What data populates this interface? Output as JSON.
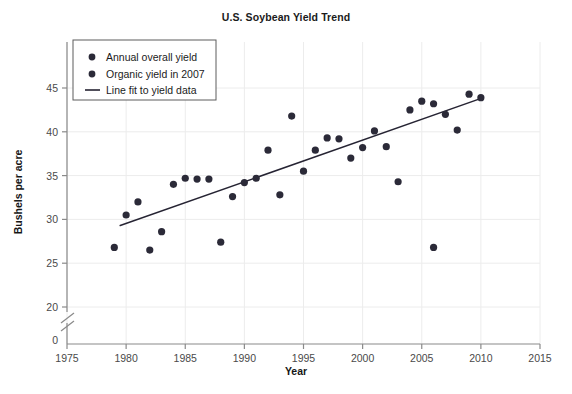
{
  "chart_data": {
    "type": "scatter",
    "title": "U.S. Soybean Yield Trend",
    "xlabel": "Year",
    "ylabel": "Bushels per acre",
    "xlim": [
      1975,
      2015
    ],
    "ylim": [
      17.5,
      47.5
    ],
    "xticks": [
      1975,
      1980,
      1985,
      1990,
      1995,
      2000,
      2005,
      2010,
      2015
    ],
    "yticks": [
      0,
      20,
      25,
      30,
      35,
      40,
      45
    ],
    "y_axis_break": true,
    "y_zero_label": "0",
    "grid": true,
    "legend_position": "upper-left",
    "series": [
      {
        "name": "Annual overall yield",
        "marker": "circle",
        "color": "#2b2a38",
        "points": [
          {
            "x": 1979,
            "y": 26.8
          },
          {
            "x": 1980,
            "y": 30.5
          },
          {
            "x": 1981,
            "y": 32.0
          },
          {
            "x": 1982,
            "y": 26.5
          },
          {
            "x": 1983,
            "y": 28.6
          },
          {
            "x": 1984,
            "y": 34.0
          },
          {
            "x": 1985,
            "y": 34.7
          },
          {
            "x": 1986,
            "y": 34.6
          },
          {
            "x": 1987,
            "y": 34.6
          },
          {
            "x": 1988,
            "y": 27.4
          },
          {
            "x": 1989,
            "y": 32.6
          },
          {
            "x": 1990,
            "y": 34.2
          },
          {
            "x": 1991,
            "y": 34.7
          },
          {
            "x": 1992,
            "y": 37.9
          },
          {
            "x": 1993,
            "y": 32.8
          },
          {
            "x": 1994,
            "y": 41.8
          },
          {
            "x": 1995,
            "y": 35.5
          },
          {
            "x": 1996,
            "y": 37.9
          },
          {
            "x": 1997,
            "y": 39.3
          },
          {
            "x": 1998,
            "y": 39.2
          },
          {
            "x": 1999,
            "y": 37.0
          },
          {
            "x": 2000,
            "y": 38.2
          },
          {
            "x": 2001,
            "y": 40.1
          },
          {
            "x": 2002,
            "y": 38.3
          },
          {
            "x": 2003,
            "y": 34.3
          },
          {
            "x": 2004,
            "y": 42.5
          },
          {
            "x": 2005,
            "y": 43.5
          },
          {
            "x": 2006,
            "y": 43.2
          },
          {
            "x": 2007,
            "y": 42.0
          },
          {
            "x": 2008,
            "y": 40.2
          },
          {
            "x": 2009,
            "y": 44.3
          },
          {
            "x": 2010,
            "y": 43.9
          }
        ]
      },
      {
        "name": "Organic yield in 2007",
        "marker": "circle",
        "color": "#2b2a38",
        "points": [
          {
            "x": 2006,
            "y": 26.8
          }
        ]
      }
    ],
    "fit_line": {
      "name": "Line fit to yield data",
      "color": "#262433",
      "x_start": 1979.5,
      "y_start": 29.3,
      "x_end": 2010.2,
      "y_end": 43.9
    }
  },
  "legend": {
    "entries": [
      {
        "label": "Annual overall yield",
        "type": "marker"
      },
      {
        "label": "Organic yield in 2007",
        "type": "marker"
      },
      {
        "label": "Line fit to yield data",
        "type": "line"
      }
    ]
  },
  "axes": {
    "x_tick_labels": [
      "1975",
      "1980",
      "1985",
      "1990",
      "1995",
      "2000",
      "2005",
      "2010",
      "2015"
    ],
    "y_tick_labels": [
      "20",
      "25",
      "30",
      "35",
      "40",
      "45"
    ],
    "y_zero": "0"
  }
}
